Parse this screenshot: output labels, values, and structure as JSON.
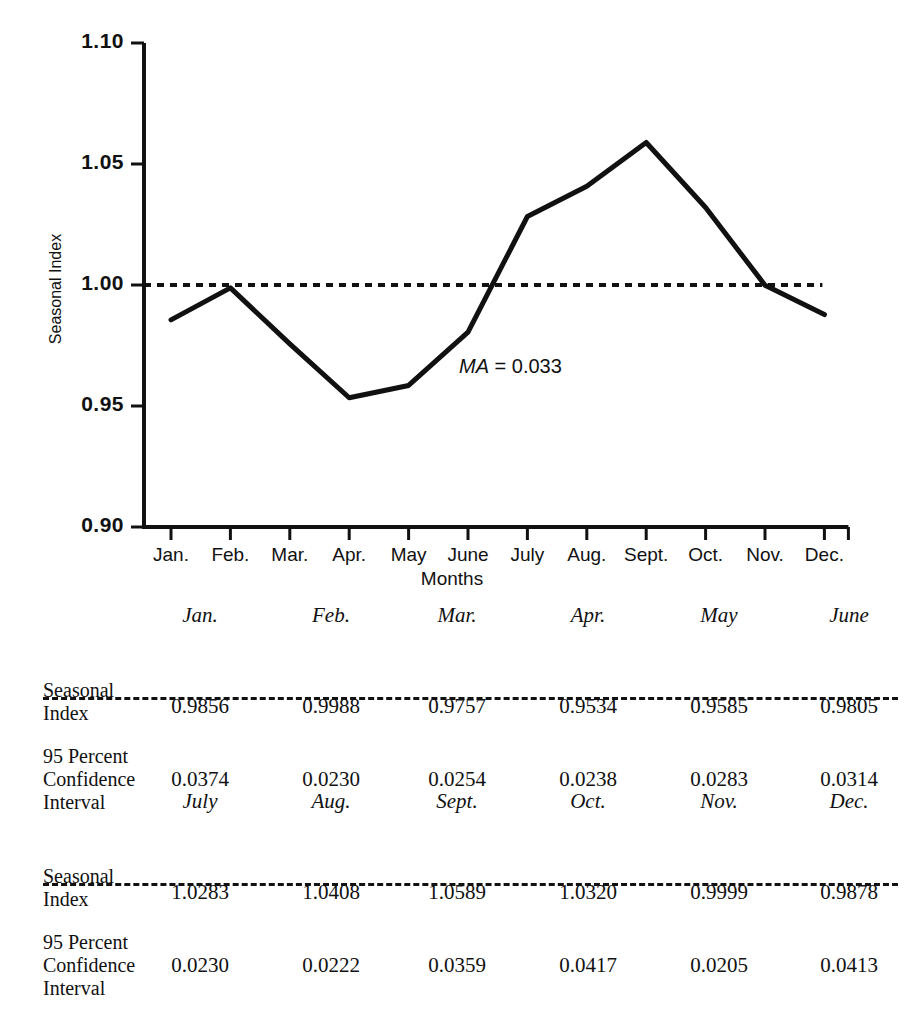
{
  "chart_data": {
    "type": "line",
    "title": "",
    "xlabel": "Months",
    "ylabel": "Seasonal Index",
    "ylim": [
      0.9,
      1.1
    ],
    "ytick_labels": [
      "1.10",
      "1.05",
      "1.00",
      "0.95",
      "0.90"
    ],
    "ytick_values": [
      1.1,
      1.05,
      1.0,
      0.95,
      0.9
    ],
    "grid": false,
    "legend": "none",
    "categories": [
      "Jan.",
      "Feb.",
      "Mar.",
      "Apr.",
      "May",
      "June",
      "July",
      "Aug.",
      "Sept.",
      "Oct.",
      "Nov.",
      "Dec."
    ],
    "values": [
      0.9856,
      0.9988,
      0.9757,
      0.9534,
      0.9585,
      0.9805,
      1.0283,
      1.0408,
      1.0589,
      1.032,
      0.9999,
      0.9878
    ],
    "series": [
      {
        "name": "Seasonal Index",
        "values": [
          0.9856,
          0.9988,
          0.9757,
          0.9534,
          0.9585,
          0.9805,
          1.0283,
          1.0408,
          1.0589,
          1.032,
          0.9999,
          0.9878
        ]
      }
    ],
    "reference_line": {
      "value": 1.0,
      "style": "dashed"
    },
    "annotations": [
      {
        "symbol": "MA",
        "text": "= 0.033",
        "value": 0.033,
        "x_frac": 0.51,
        "y_value": 0.962
      }
    ]
  },
  "axis": {
    "y_title": "Seasonal Index",
    "x_title": "Months",
    "y_ticks": [
      "1.10",
      "1.05",
      "1.00",
      "0.95",
      "0.90"
    ],
    "x_ticks": [
      "Jan.",
      "Feb.",
      "Mar.",
      "Apr.",
      "May",
      "June",
      "July",
      "Aug.",
      "Sept.",
      "Oct.",
      "Nov.",
      "Dec."
    ]
  },
  "annotation": {
    "ma_symbol": "MA",
    "ma_value": "= 0.033"
  },
  "tables": [
    {
      "headers": [
        "Jan.",
        "Feb.",
        "Mar.",
        "Apr.",
        "May",
        "June"
      ],
      "rows": [
        {
          "label": "Seasonal\nIndex",
          "values": [
            "0.9856",
            "0.9988",
            "0.9757",
            "0.9534",
            "0.9585",
            "0.9805"
          ]
        },
        {
          "label": "95 Percent\nConfidence\nInterval",
          "values": [
            "0.0374",
            "0.0230",
            "0.0254",
            "0.0238",
            "0.0283",
            "0.0314"
          ]
        }
      ]
    },
    {
      "headers": [
        "July",
        "Aug.",
        "Sept.",
        "Oct.",
        "Nov.",
        "Dec."
      ],
      "rows": [
        {
          "label": "Seasonal\nIndex",
          "values": [
            "1.0283",
            "1.0408",
            "1.0589",
            "1.0320",
            "0.9999",
            "0.9878"
          ]
        },
        {
          "label": "95 Percent\nConfidence\nInterval",
          "values": [
            "0.0230",
            "0.0222",
            "0.0359",
            "0.0417",
            "0.0205",
            "0.0413"
          ]
        }
      ]
    }
  ],
  "colors": {
    "ink": "#111111",
    "background": "#ffffff"
  }
}
